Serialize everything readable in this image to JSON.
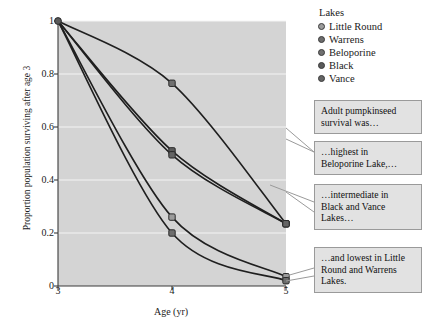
{
  "chart_data": {
    "type": "line",
    "title": "",
    "xlabel": "Age (yr)",
    "ylabel": "Proportion population surviving after age 3",
    "x": [
      3,
      4,
      5
    ],
    "xlim": [
      3,
      5
    ],
    "ylim": [
      0,
      1
    ],
    "xticks": [
      "3",
      "4",
      "5"
    ],
    "yticks": [
      "0",
      "0.2",
      "0.4",
      "0.6",
      "0.8",
      "1"
    ],
    "grid": "horizontal",
    "legend_title": "Lakes",
    "legend_position": "top-right",
    "series": [
      {
        "name": "Little Round",
        "color": "#9b9b9b",
        "values": [
          1,
          0.26,
          0.035
        ]
      },
      {
        "name": "Warrens",
        "color": "#6d6d6d",
        "values": [
          1,
          0.2,
          0.02
        ]
      },
      {
        "name": "Beloporine",
        "color": "#707070",
        "values": [
          1,
          0.765,
          0.235
        ]
      },
      {
        "name": "Black",
        "color": "#5a5a5a",
        "values": [
          1,
          0.51,
          0.235
        ]
      },
      {
        "name": "Vance",
        "color": "#646464",
        "values": [
          1,
          0.495,
          0.235
        ]
      }
    ]
  },
  "legend": {
    "title": "Lakes",
    "items": [
      {
        "label": "Little Round"
      },
      {
        "label": "Warrens"
      },
      {
        "label": "Beloporine"
      },
      {
        "label": "Black"
      },
      {
        "label": "Vance"
      }
    ]
  },
  "axes": {
    "x_title": "Age (yr)",
    "y_title": "Proportion population surviving after age 3",
    "xticks": [
      "3",
      "4",
      "5"
    ],
    "yticks": [
      "1",
      "0.8",
      "0.6",
      "0.4",
      "0.2",
      "0"
    ]
  },
  "callouts": [
    {
      "line1": "Adult pumpkinseed",
      "line2": "survival was…",
      "line3": ""
    },
    {
      "line1": "…highest in",
      "line2": "Beloporine Lake,…",
      "line3": ""
    },
    {
      "line1": "…intermediate in",
      "line2": "Black and Vance",
      "line3": "Lakes…"
    },
    {
      "line1": "…and lowest in Little",
      "line2": "Round and Warrens",
      "line3": "Lakes."
    }
  ],
  "colors": {
    "plot_background": "#d4d4d4",
    "grid": "#f2f2f2",
    "axis": "#3b3b3b",
    "curve": "#1f1f1f",
    "callout_bg": "#e2e2e2",
    "callout_border": "#9a9a9a"
  }
}
